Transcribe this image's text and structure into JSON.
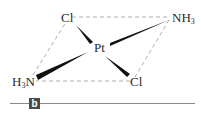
{
  "figure": {
    "panel_label": "b",
    "center_atom": "Pt",
    "ligands": [
      {
        "id": "cl-top-left",
        "symbol": "Cl",
        "sub": "",
        "bond": "wedge"
      },
      {
        "id": "nh3-top-right",
        "symbol": "NH",
        "sub": "3",
        "bond": "wedge-thin"
      },
      {
        "id": "h3n-bottom-left",
        "symbol_pre": "H",
        "sub": "3",
        "symbol_post": "N",
        "bond": "wedge"
      },
      {
        "id": "cl-bottom-right",
        "symbol": "Cl",
        "sub": "",
        "bond": "wedge"
      }
    ],
    "outline_style": "dashed parallelogram",
    "colors": {
      "bond": "#111111",
      "dashed": "#999999",
      "label_bg": "#4a4a4a",
      "rule": "#8a8a8a"
    }
  }
}
